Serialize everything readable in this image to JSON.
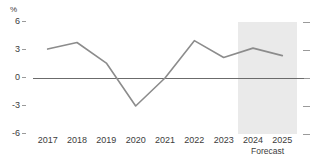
{
  "chart_data": {
    "type": "line",
    "title": "",
    "subtitle": "",
    "xlabel": "",
    "ylabel": "%",
    "unit_label": "%",
    "categories": [
      "2017",
      "2018",
      "2019",
      "2020",
      "2021",
      "2022",
      "2023",
      "2024",
      "2025"
    ],
    "x": [
      2017,
      2018,
      2019,
      2020,
      2021,
      2022,
      2023,
      2024,
      2025
    ],
    "values": [
      3.1,
      3.8,
      1.6,
      -3.0,
      0.0,
      4.0,
      2.2,
      3.2,
      2.4
    ],
    "series": [
      {
        "name": "",
        "color": "#8c8c8c",
        "values": [
          3.1,
          3.8,
          1.6,
          -3.0,
          0.0,
          4.0,
          2.2,
          3.2,
          2.4
        ]
      }
    ],
    "ylim": [
      -6,
      6
    ],
    "yticks": [
      6,
      3,
      0,
      -3,
      -6
    ],
    "ytick_labels": [
      "6",
      "3",
      "0",
      "-3",
      "-6"
    ],
    "grid": false,
    "legend": null,
    "legend_position": "none",
    "zero_line": 0,
    "annotations": [
      {
        "name": "forecast-band",
        "label": "Forecast",
        "from": 2023.5,
        "to": 2025.5,
        "color": "#eaeaea"
      }
    ],
    "colors": {
      "series_line": "#8c8c8c",
      "zero_line": "#6b6b6b",
      "forecast_band": "#eaeaea",
      "tick_mark": "#9a9a9a",
      "text": "#3c3c3c",
      "background": "#ffffff"
    }
  },
  "axes": {
    "y_ticks": [
      {
        "label": "6",
        "value": 6
      },
      {
        "label": "3",
        "value": 3
      },
      {
        "label": "0",
        "value": 0
      },
      {
        "label": "-3",
        "value": -3
      },
      {
        "label": "-6",
        "value": -6
      }
    ],
    "x_ticks": [
      {
        "label": "2017"
      },
      {
        "label": "2018"
      },
      {
        "label": "2019"
      },
      {
        "label": "2020"
      },
      {
        "label": "2021"
      },
      {
        "label": "2022"
      },
      {
        "label": "2023"
      },
      {
        "label": "2024"
      },
      {
        "label": "2025"
      }
    ]
  },
  "labels": {
    "unit": "%",
    "forecast": "Forecast"
  }
}
